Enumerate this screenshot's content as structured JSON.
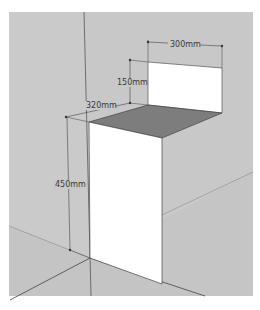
{
  "diagram": {
    "type": "3d-sketch",
    "colors": {
      "background": "#ffffff",
      "wall": "#c8c8c8",
      "floor": "#c6c6c6",
      "box_front": "#ffffff",
      "backsplash": "#ffffff",
      "top_surface": "#7a7a7a",
      "edge": "#3c3c3c",
      "dimension_text": "#3a3a3a"
    },
    "dimensions": {
      "width_top": "300mm",
      "backsplash_height": "150mm",
      "depth": "320mm",
      "height": "450mm"
    }
  }
}
